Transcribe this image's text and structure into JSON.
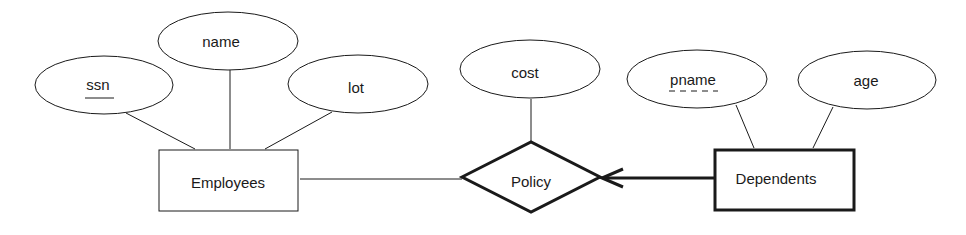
{
  "diagram": {
    "type": "er-diagram",
    "entities": [
      {
        "id": "employees",
        "label": "Employees",
        "weak": false,
        "attributes": [
          "ssn",
          "name",
          "lot"
        ]
      },
      {
        "id": "dependents",
        "label": "Dependents",
        "weak": true,
        "attributes": [
          "pname",
          "age"
        ]
      }
    ],
    "relationships": [
      {
        "id": "policy",
        "label": "Policy",
        "identifying": true,
        "attributes": [
          "cost"
        ],
        "participants": [
          {
            "entity": "employees",
            "line": "thin"
          },
          {
            "entity": "dependents",
            "line": "thick-arrow",
            "total_participation": true,
            "key_constraint": true
          }
        ]
      }
    ],
    "attributes": {
      "ssn": {
        "label": "ssn",
        "key": "primary-key",
        "underline": "solid"
      },
      "name": {
        "label": "name",
        "key": "none"
      },
      "lot": {
        "label": "lot",
        "key": "none"
      },
      "cost": {
        "label": "cost",
        "key": "none"
      },
      "pname": {
        "label": "pname",
        "key": "partial-key",
        "underline": "dashed"
      },
      "age": {
        "label": "age",
        "key": "none"
      }
    }
  },
  "colors": {
    "stroke": "#1a1a1a",
    "background": "#ffffff"
  }
}
